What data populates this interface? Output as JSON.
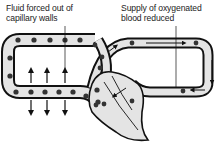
{
  "labels": {
    "left": {
      "line1": "Fluid forced out of",
      "line2": "capillary walls"
    },
    "right": {
      "line1": "Supply of oxygenated",
      "line2": "blood reduced"
    }
  },
  "colors": {
    "vessel_fill": "#e4e4e4",
    "outline": "#111111",
    "cell": "#333333",
    "background": "#ffffff"
  },
  "elements": {
    "left_capillary_loop": "capillary-loop with blood cells",
    "right_capillary_loop": "vessel loop with flow arrows",
    "chamber": "enlarged chamber (shaded)",
    "fluid_arrows_up": 3,
    "fluid_arrows_down": 3
  }
}
